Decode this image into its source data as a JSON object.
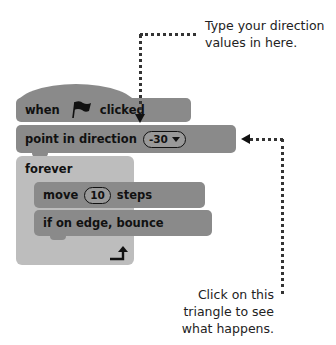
{
  "blocks": {
    "hat": {
      "when": "when",
      "flag_icon": "green-flag",
      "clicked": "clicked"
    },
    "point": {
      "label": "point in direction",
      "value": "-30",
      "dropdown_icon": "triangle-down"
    },
    "forever": {
      "label": "forever",
      "loop_icon": "loop-arrow"
    },
    "move": {
      "move": "move",
      "value": "10",
      "steps": "steps"
    },
    "bounce": {
      "label": "if on edge, bounce"
    }
  },
  "annotations": {
    "top_line1": "Type your direction",
    "top_line2": "values in here.",
    "bottom_line1": "Click on this",
    "bottom_line2": "triangle to see",
    "bottom_line3": "what happens."
  },
  "colors": {
    "motion_block": "#8a8a8a",
    "control_block": "#bdbdbd",
    "text": "#111111",
    "annotation_line": "#333333"
  }
}
